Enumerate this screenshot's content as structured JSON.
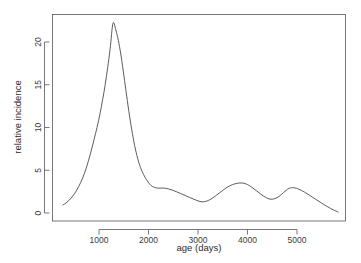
{
  "chart_data": {
    "type": "line",
    "title": "",
    "xlabel": "age (days)",
    "ylabel": "relative incidence",
    "xlim": [
      170,
      5900
    ],
    "ylim": [
      0,
      22.8
    ],
    "grid": false,
    "legend": null,
    "x_ticks": [
      1000,
      2000,
      3000,
      4000,
      5000
    ],
    "x_tick_labels": [
      "1000",
      "2000",
      "3000",
      "4000",
      "5000"
    ],
    "y_ticks": [
      0,
      5,
      10,
      15,
      20
    ],
    "y_tick_labels": [
      "0",
      "5",
      "10",
      "15",
      "20"
    ],
    "series": [
      {
        "name": "relative incidence",
        "color": "#4a4a4a",
        "x": [
          273,
          350,
          430,
          510,
          590,
          670,
          750,
          830,
          900,
          960,
          1020,
          1075,
          1125,
          1175,
          1225,
          1283,
          1340,
          1390,
          1440,
          1490,
          1545,
          1600,
          1660,
          1720,
          1780,
          1840,
          1900,
          1960,
          2020,
          2080,
          2150,
          2210,
          2270,
          2330,
          2400,
          2480,
          2560,
          2650,
          2740,
          2830,
          2920,
          3000,
          3080,
          3170,
          3260,
          3350,
          3450,
          3550,
          3650,
          3750,
          3830,
          3910,
          4000,
          4090,
          4180,
          4270,
          4360,
          4455,
          4550,
          4640,
          4730,
          4840,
          4940,
          5040,
          5150,
          5260,
          5380,
          5500,
          5620,
          5730,
          5830
        ],
        "y": [
          0.94,
          1.25,
          1.7,
          2.3,
          3.1,
          4.1,
          5.4,
          7.0,
          8.6,
          10.0,
          11.6,
          13.3,
          15.0,
          17.0,
          19.2,
          22.2,
          21.4,
          20.2,
          18.6,
          16.6,
          14.3,
          12.0,
          9.8,
          7.9,
          6.4,
          5.3,
          4.5,
          3.9,
          3.4,
          3.1,
          2.95,
          2.9,
          2.92,
          2.9,
          2.82,
          2.68,
          2.5,
          2.28,
          2.05,
          1.82,
          1.6,
          1.42,
          1.3,
          1.38,
          1.62,
          1.98,
          2.42,
          2.86,
          3.2,
          3.42,
          3.5,
          3.5,
          3.33,
          3.0,
          2.6,
          2.2,
          1.85,
          1.62,
          1.68,
          1.95,
          2.4,
          2.88,
          2.95,
          2.78,
          2.45,
          2.05,
          1.6,
          1.15,
          0.72,
          0.38,
          0.12
        ]
      }
    ]
  },
  "axes": {
    "x_title": "age (days)",
    "y_title": "relative incidence"
  }
}
